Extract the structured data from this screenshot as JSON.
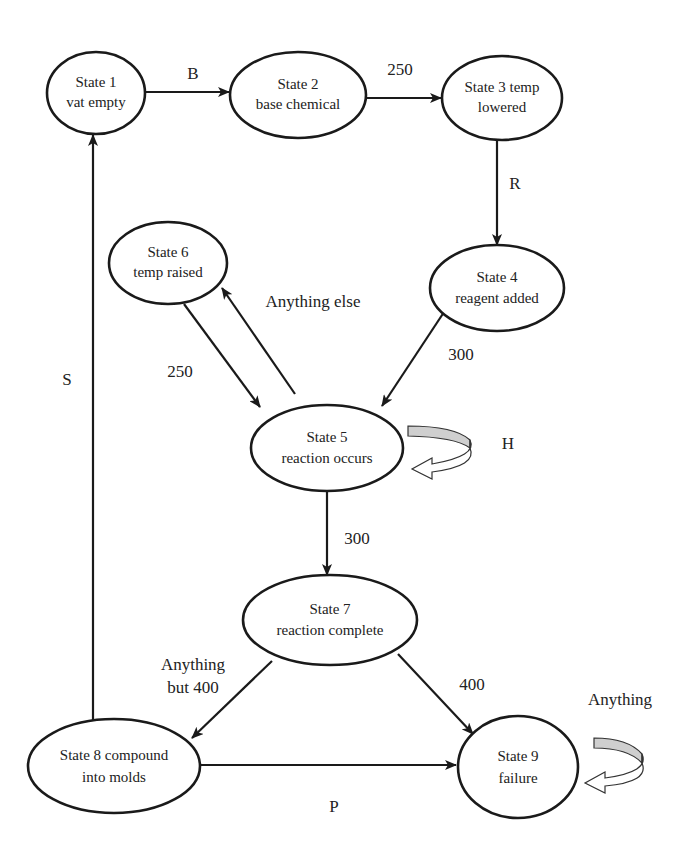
{
  "diagram": {
    "type": "state-machine",
    "nodes": [
      {
        "id": "s1",
        "line1": "State 1",
        "line2": "vat empty"
      },
      {
        "id": "s2",
        "line1": "State 2",
        "line2": "base chemical"
      },
      {
        "id": "s3",
        "line1": "State 3 temp",
        "line2": "lowered"
      },
      {
        "id": "s4",
        "line1": "State 4",
        "line2": "reagent added"
      },
      {
        "id": "s5",
        "line1": "State 5",
        "line2": "reaction occurs"
      },
      {
        "id": "s6",
        "line1": "State 6",
        "line2": "temp raised"
      },
      {
        "id": "s7",
        "line1": "State 7",
        "line2": "reaction complete"
      },
      {
        "id": "s8",
        "line1": "State 8 compound",
        "line2": "into molds"
      },
      {
        "id": "s9",
        "line1": "State 9",
        "line2": "failure"
      }
    ],
    "edges": [
      {
        "from": "s1",
        "to": "s2",
        "label": "B"
      },
      {
        "from": "s2",
        "to": "s3",
        "label": "250"
      },
      {
        "from": "s3",
        "to": "s4",
        "label": "R"
      },
      {
        "from": "s4",
        "to": "s5",
        "label": "300"
      },
      {
        "from": "s6",
        "to": "s5",
        "label": "250"
      },
      {
        "from": "s5",
        "to": "s6",
        "label": "Anything else"
      },
      {
        "from": "s5",
        "to": "s5",
        "label": "H"
      },
      {
        "from": "s5",
        "to": "s7",
        "label": "300"
      },
      {
        "from": "s7",
        "to": "s8",
        "label_line1": "Anything",
        "label_line2": "but 400"
      },
      {
        "from": "s7",
        "to": "s9",
        "label": "400"
      },
      {
        "from": "s8",
        "to": "s9",
        "label": "P"
      },
      {
        "from": "s8",
        "to": "s1",
        "label": "S"
      },
      {
        "from": "s9",
        "to": "s9",
        "label": "Anything"
      }
    ]
  }
}
